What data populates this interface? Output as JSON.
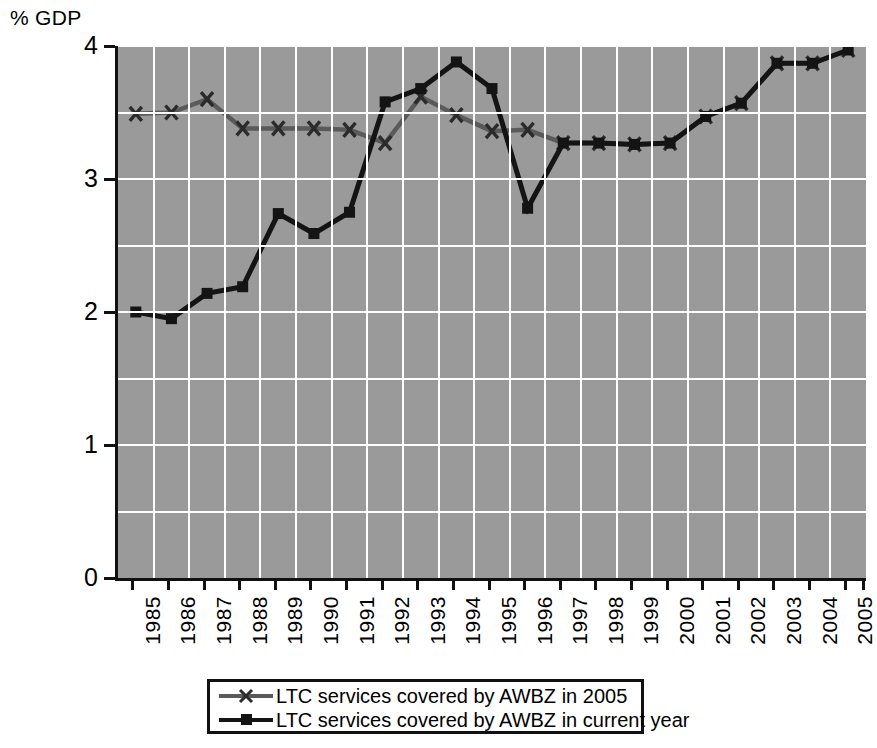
{
  "chart_data": {
    "type": "line",
    "title": "",
    "subtitle": "",
    "xlabel": "",
    "ylabel": "% GDP",
    "ylim": [
      0,
      4
    ],
    "xlim": [
      1985,
      2005
    ],
    "grid": true,
    "legend_position": "bottom",
    "y_unit_caption": "% GDP",
    "y_ticks": [
      "0",
      "1",
      "2",
      "3",
      "4"
    ],
    "y_tick_values": [
      0,
      1,
      2,
      3,
      4
    ],
    "y_minor_gridline_values": [
      0.5,
      1.5,
      2.5,
      3.5
    ],
    "categories": [
      "1985",
      "1986",
      "1987",
      "1988",
      "1989",
      "1990",
      "1991",
      "1992",
      "1993",
      "1994",
      "1995",
      "1996",
      "1997",
      "1998",
      "1999",
      "2000",
      "2001",
      "2002",
      "2003",
      "2004",
      "2005"
    ],
    "x": [
      1985,
      1986,
      1987,
      1988,
      1989,
      1990,
      1991,
      1992,
      1993,
      1994,
      1995,
      1996,
      1997,
      1998,
      1999,
      2000,
      2001,
      2002,
      2003,
      2004,
      2005
    ],
    "series": [
      {
        "name": "LTC services covered by AWBZ in 2005",
        "color": "#5a5a5a",
        "marker": "x",
        "values": [
          3.49,
          3.5,
          3.6,
          3.38,
          3.38,
          3.38,
          3.37,
          3.27,
          3.62,
          3.48,
          3.36,
          3.37,
          3.27,
          3.27,
          3.26,
          3.27,
          3.47,
          3.57,
          3.87,
          3.87,
          3.97
        ]
      },
      {
        "name": "LTC services covered by AWBZ in current year",
        "color": "#141414",
        "marker": "square",
        "values": [
          2.0,
          1.95,
          2.14,
          2.19,
          2.74,
          2.59,
          2.75,
          3.58,
          3.68,
          3.88,
          3.68,
          2.78,
          3.27,
          3.27,
          3.26,
          3.27,
          3.47,
          3.57,
          3.87,
          3.87,
          3.97
        ]
      }
    ]
  },
  "legend": {
    "entries": [
      {
        "label": "LTC services covered by AWBZ in 2005",
        "color": "#5a5a5a",
        "marker": "x"
      },
      {
        "label": "LTC services covered by AWBZ in current year",
        "color": "#141414",
        "marker": "square"
      }
    ]
  },
  "colors": {
    "plot_background": "#9a9a9a",
    "gridline": "#ffffff",
    "axis": "#111111",
    "series_2005": "#5a5a5a",
    "series_current": "#141414",
    "page_background": "#ffffff"
  }
}
